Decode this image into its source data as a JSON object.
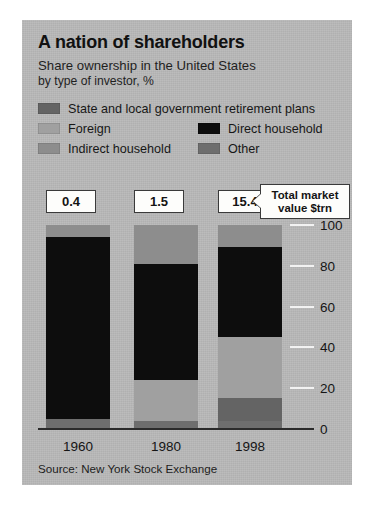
{
  "title": "A nation of shareholders",
  "subtitle_line1": "Share ownership in the United States",
  "subtitle_line2": "by type of investor, %",
  "source": "Source: New York Stock Exchange",
  "callout": {
    "line1": "Total market",
    "line2": "value $trn"
  },
  "legend": [
    {
      "label": "State and local government retirement plans",
      "color": "#646464"
    },
    {
      "label": "Foreign",
      "color": "#a0a0a0"
    },
    {
      "label": "Direct household",
      "color": "#0d0d0d"
    },
    {
      "label": "Indirect household",
      "color": "#8d8d8d"
    },
    {
      "label": "Other",
      "color": "#6e6e6e"
    }
  ],
  "market_values": [
    "0.4",
    "1.5",
    "15.4"
  ],
  "chart_data": {
    "type": "bar",
    "title": "A nation of shareholders",
    "subtitle": "Share ownership in the United States by type of investor, %",
    "xlabel": "",
    "ylabel": "%",
    "ylim": [
      0,
      100
    ],
    "yticks": [
      0,
      20,
      40,
      60,
      80,
      100
    ],
    "grid": true,
    "stacked": true,
    "legend_position": "top",
    "categories": [
      "1960",
      "1980",
      "1998"
    ],
    "series": [
      {
        "name": "Other",
        "color": "#6e6e6e",
        "values": [
          5.0,
          4.0,
          4.0
        ]
      },
      {
        "name": "State and local government retirement plans",
        "color": "#646464",
        "values": [
          0.0,
          0.0,
          11.0
        ]
      },
      {
        "name": "Foreign",
        "color": "#a0a0a0",
        "values": [
          0.0,
          20.0,
          30.0
        ]
      },
      {
        "name": "Direct household",
        "color": "#0d0d0d",
        "values": [
          89.0,
          57.0,
          44.0
        ]
      },
      {
        "name": "Indirect household",
        "color": "#8d8d8d",
        "values": [
          6.0,
          19.0,
          11.0
        ]
      }
    ],
    "annotations": [
      {
        "category": "1960",
        "label": "0.4",
        "note": "Total market value $trn"
      },
      {
        "category": "1980",
        "label": "1.5",
        "note": "Total market value $trn"
      },
      {
        "category": "1998",
        "label": "15.4",
        "note": "Total market value $trn"
      }
    ],
    "source": "Source: New York Stock Exchange"
  }
}
